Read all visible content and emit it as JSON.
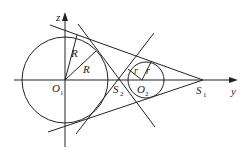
{
  "diagram": {
    "colors": {
      "stroke": "#222222",
      "background": "#ffffff"
    },
    "axes": {
      "horizontal": {
        "label": "y"
      },
      "vertical": {
        "label": "z"
      }
    },
    "circles": [
      {
        "name": "O",
        "sub": "1",
        "radius_label": "R"
      },
      {
        "name": "O",
        "sub": "2",
        "radius_label": "r"
      }
    ],
    "points": [
      {
        "name": "S",
        "sub": "1"
      },
      {
        "name": "S",
        "sub": "2"
      }
    ],
    "labels": {
      "z": "z",
      "y": "y",
      "R1": "R",
      "R2": "R",
      "r1": "r",
      "r2": "r",
      "O1_main": "O",
      "O1_sub": "1",
      "O2_main": "O",
      "O2_sub": "2",
      "S1_main": "S",
      "S1_sub": "1",
      "S2_main": "S",
      "S2_sub": "2"
    }
  }
}
